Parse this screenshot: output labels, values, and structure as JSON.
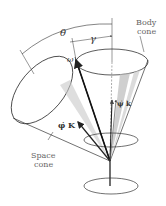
{
  "labels": {
    "theta": "θ",
    "gamma": "γ",
    "omega": "ω",
    "body_cone_line1": "Body",
    "body_cone_line2": "cone",
    "space_cone_line1": "Space",
    "space_cone_line2": "cone",
    "phi_dot_K": "φ̇ K",
    "psi_dot_k": "ψ̇ k"
  },
  "colors": {
    "line": "#222222",
    "shade": "#b8b8b8",
    "text": "#333333"
  }
}
